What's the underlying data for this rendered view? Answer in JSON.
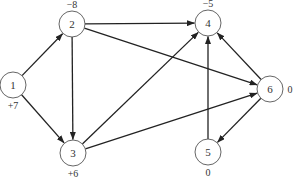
{
  "diagram": {
    "type": "directed-network-flow-graph",
    "node_radius": 13,
    "colors": {
      "edge": "#222222",
      "node_stroke": "#555555",
      "text": "#333333",
      "background": "#ffffff"
    },
    "nodes": [
      {
        "id": "1",
        "label": "1",
        "supply": "+7",
        "x": 13,
        "y": 85,
        "supply_pos": "below"
      },
      {
        "id": "2",
        "label": "2",
        "supply": "−8",
        "x": 72,
        "y": 24,
        "supply_pos": "above"
      },
      {
        "id": "3",
        "label": "3",
        "supply": "+6",
        "x": 73,
        "y": 153,
        "supply_pos": "below"
      },
      {
        "id": "4",
        "label": "4",
        "supply": "−5",
        "x": 208,
        "y": 23,
        "supply_pos": "above"
      },
      {
        "id": "5",
        "label": "5",
        "supply": "0",
        "x": 208,
        "y": 152,
        "supply_pos": "below"
      },
      {
        "id": "6",
        "label": "6",
        "supply": "0",
        "x": 270,
        "y": 89,
        "supply_pos": "right"
      }
    ],
    "edges": [
      {
        "from": "1",
        "to": "2"
      },
      {
        "from": "1",
        "to": "3"
      },
      {
        "from": "2",
        "to": "3"
      },
      {
        "from": "2",
        "to": "4"
      },
      {
        "from": "2",
        "to": "6"
      },
      {
        "from": "3",
        "to": "4"
      },
      {
        "from": "3",
        "to": "6"
      },
      {
        "from": "5",
        "to": "4"
      },
      {
        "from": "6",
        "to": "4"
      },
      {
        "from": "6",
        "to": "5"
      }
    ]
  }
}
